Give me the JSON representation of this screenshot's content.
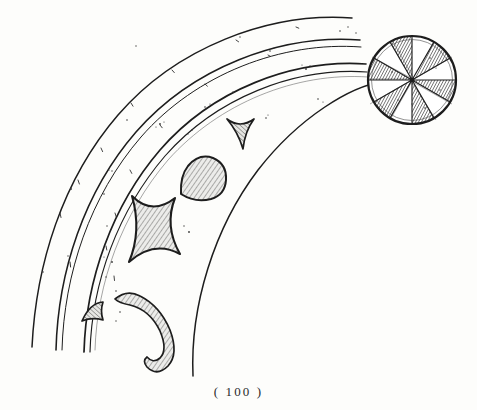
{
  "page": {
    "background_color": "#fdfdfb",
    "ink_color": "#1d1d1d",
    "width": 477,
    "height": 410
  },
  "caption": {
    "text": "( 100 )",
    "page_number": "100",
    "open_paren": "(",
    "close_paren": ")"
  },
  "figure": {
    "ink_color": "#1d1d1d",
    "hatch_color": "#6d6d6d",
    "fill_color": "#e9e9e6"
  },
  "arcs": {
    "center_x": 413,
    "center_y": 83,
    "items": [
      {
        "name": "outer-arc",
        "radius": 352,
        "stroke": 1.5
      },
      {
        "name": "band-outer-upper-edge",
        "radius": 322,
        "stroke": 1.4
      },
      {
        "name": "band-outer-lower-edge",
        "radius": 312,
        "stroke": 1.1
      },
      {
        "name": "band-inner-upper-edge",
        "radius": 299,
        "stroke": 1.6
      },
      {
        "name": "band-inner-lower-edge",
        "radius": 290,
        "stroke": 1.2
      },
      {
        "name": "inner-arc",
        "radius": 246,
        "stroke": 1.5
      }
    ]
  },
  "rosette": {
    "name": "radial-rosette",
    "center_x": 412,
    "center_y": 80,
    "outer_radius": 47,
    "inner_radius": 43,
    "spoke_count": 12,
    "shaded_wedges": 6,
    "rim_stroke": 2.2
  },
  "ornaments": [
    {
      "name": "deltoid-ornament",
      "shape": "three-pointed-concave-triangle",
      "cx": 240,
      "cy": 128,
      "size": 21
    },
    {
      "name": "teardrop-ornament",
      "shape": "teardrop-disc",
      "cx": 198,
      "cy": 174,
      "size": 21
    },
    {
      "name": "astroid-ornament",
      "shape": "four-pointed-concave-square",
      "cx": 152,
      "cy": 228,
      "size": 32
    },
    {
      "name": "comma-hook-ornament",
      "shape": "tapered-curl",
      "cx": 135,
      "cy": 325,
      "size": 38
    },
    {
      "name": "wing-fragment-ornament",
      "shape": "small-curved-wedge",
      "cx": 95,
      "cy": 313,
      "size": 15
    }
  ],
  "speckles": {
    "name": "ink-speckles",
    "count": 38,
    "color": "#3a3a3a"
  }
}
